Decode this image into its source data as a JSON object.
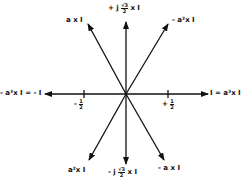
{
  "diagram": {
    "type": "phasor-diagram",
    "center": [
      126,
      94
    ],
    "colors": {
      "line": "#111111",
      "background": "#ffffff"
    },
    "axis": {
      "ticks": [
        {
          "id": "neg-half",
          "label": "- 1/2",
          "x": 84
        },
        {
          "id": "pos-half",
          "label": "+ 1/2",
          "x": 168
        }
      ]
    },
    "arrows": [
      {
        "id": "up",
        "to": [
          126,
          22
        ],
        "label": "+j √3/2 x I"
      },
      {
        "id": "minus-a2",
        "to": [
          168,
          24
        ],
        "label": "-a²x I"
      },
      {
        "id": "a",
        "to": [
          88,
          24
        ],
        "label": "a x I"
      },
      {
        "id": "right",
        "to": [
          208,
          94
        ],
        "label": "I = a³x I"
      },
      {
        "id": "left",
        "to": [
          45,
          94
        ],
        "label": "-a³x I = -I"
      },
      {
        "id": "a2",
        "to": [
          89,
          160
        ],
        "label": "a²x I"
      },
      {
        "id": "down",
        "to": [
          126,
          164
        ],
        "label": "-j √3/2 x I"
      },
      {
        "id": "minus-a",
        "to": [
          164,
          160
        ],
        "label": "-a x I"
      }
    ],
    "labels": {
      "up_prefix": "+ j",
      "up_num": "√3",
      "up_den": "2",
      "up_suffix": "x I",
      "down_prefix": "- j",
      "down_num": "√3",
      "down_den": "2",
      "down_suffix": "x I",
      "minus_a2": "- a²x I",
      "a": "a x I",
      "right": "I = a³x I",
      "left": "- a³x I = - I",
      "a2": "a²x I",
      "minus_a": "- a x I",
      "neg_half_sign": "-",
      "pos_half_sign": "+",
      "half_num": "1",
      "half_den": "2"
    }
  }
}
